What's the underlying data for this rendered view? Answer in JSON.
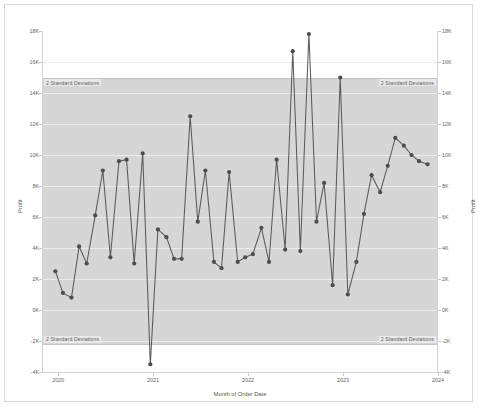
{
  "chart_data": {
    "type": "line",
    "title": "",
    "xlabel": "Month of Order Date",
    "ylabel": "Profit",
    "ylabel_right": "Profit",
    "ylim": [
      -4000,
      18000
    ],
    "ytick_values": [
      18000,
      16000,
      14000,
      12000,
      10000,
      8000,
      6000,
      4000,
      2000,
      0,
      -2000,
      -4000
    ],
    "ytick_labels": [
      "18K",
      "16K",
      "14K",
      "12K",
      "10K",
      "8K",
      "6K",
      "4K",
      "2K",
      "0K",
      "-2K",
      "-4K"
    ],
    "xtick_labels": [
      "2020",
      "2021",
      "2022",
      "2023",
      "2024"
    ],
    "xtick_values": [
      2020.0,
      2021.0,
      2022.0,
      2023.0,
      2024.0
    ],
    "xlim": [
      2019.83,
      2024.0
    ],
    "grid": true,
    "legend": "none",
    "reference_band": {
      "label": "2 Standard Deviations",
      "upper": 15000,
      "lower": -2200,
      "fill_color": "#d6d6d6",
      "label_positions": [
        "top-left",
        "top-right",
        "bottom-left",
        "bottom-right"
      ]
    },
    "series": [
      {
        "name": "Profit",
        "color": "#4d4d4d",
        "marker": "circle",
        "x": [
          2019.96,
          2020.04,
          2020.13,
          2020.21,
          2020.29,
          2020.38,
          2020.46,
          2020.54,
          2020.63,
          2020.71,
          2020.79,
          2020.88,
          2020.96,
          2021.04,
          2021.13,
          2021.21,
          2021.29,
          2021.38,
          2021.46,
          2021.54,
          2021.63,
          2021.71,
          2021.79,
          2021.88,
          2021.96,
          2022.04,
          2022.13,
          2022.21,
          2022.29,
          2022.38,
          2022.46,
          2022.54,
          2022.63,
          2022.71,
          2022.79,
          2022.88,
          2022.96,
          2023.04,
          2023.13,
          2023.21,
          2023.29,
          2023.38,
          2023.46,
          2023.54,
          2023.63,
          2023.71,
          2023.79,
          2023.88
        ],
        "values": [
          2500,
          1100,
          800,
          4100,
          3000,
          6100,
          9000,
          3400,
          9600,
          9700,
          3000,
          10100,
          -3500,
          5200,
          4700,
          3300,
          3300,
          12500,
          5700,
          9000,
          3100,
          2700,
          8900,
          3100,
          3400,
          3600,
          5300,
          3100,
          9700,
          3900,
          16700,
          3800,
          17800,
          5700,
          8200,
          1600,
          15000,
          1000,
          3100,
          6200,
          8700,
          7600,
          9300,
          11100,
          10600,
          10000,
          9600,
          9400
        ]
      }
    ]
  }
}
